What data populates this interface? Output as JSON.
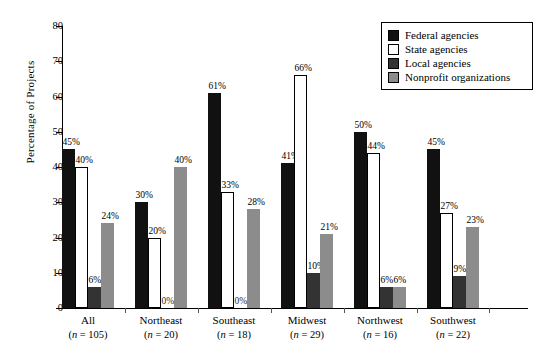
{
  "chart_data": {
    "type": "bar",
    "title": "",
    "xlabel": "",
    "ylabel": "Percentage of Projects",
    "ylim": [
      0,
      80
    ],
    "ytick_values": [
      0,
      10,
      20,
      30,
      40,
      50,
      60,
      70,
      80
    ],
    "ytick_labels": [
      "0",
      "10",
      "20",
      "30",
      "40",
      "50",
      "60",
      "70",
      "80"
    ],
    "grid": false,
    "legend_position": "top-right",
    "categories": [
      "All",
      "Northeast",
      "Southeast",
      "Midwest",
      "Northwest",
      "Southwest"
    ],
    "category_sublabels": [
      "(n = 105)",
      "(n = 20)",
      "(n = 18)",
      "(n = 29)",
      "(n = 16)",
      "(n = 22)"
    ],
    "series": [
      {
        "name": "Federal agencies",
        "color": "#111111",
        "values": [
          45,
          30,
          61,
          41,
          50,
          45
        ],
        "labels": [
          "45%",
          "30%",
          "61%",
          "41%",
          "50%",
          "45%"
        ]
      },
      {
        "name": "State agencies",
        "color": "#ffffff",
        "values": [
          40,
          20,
          33,
          66,
          44,
          27
        ],
        "labels": [
          "40%",
          "20%",
          "33%",
          "66%",
          "44%",
          "27%"
        ]
      },
      {
        "name": "Local agencies",
        "color": "#333333",
        "values": [
          6,
          0,
          0,
          10,
          6,
          9
        ],
        "labels": [
          "6%",
          "0%",
          "0%",
          "10%",
          "6%",
          "9%"
        ]
      },
      {
        "name": "Nonprofit organizations",
        "color": "#8c8c8c",
        "values": [
          24,
          40,
          28,
          21,
          6,
          23
        ],
        "labels": [
          "24%",
          "40%",
          "28%",
          "21%",
          "6%",
          "23%"
        ]
      }
    ]
  },
  "axis": {
    "y_label": "Percentage of Projects",
    "y_ticks": [
      "80",
      "70",
      "60",
      "50",
      "40",
      "30",
      "20",
      "10",
      "0"
    ]
  },
  "groups": [
    {
      "name": "All",
      "n": "(n = 105)",
      "bars": [
        {
          "label": "45%",
          "value": 45,
          "cls": "federal"
        },
        {
          "label": "40%",
          "value": 40,
          "cls": "state"
        },
        {
          "label": "6%",
          "value": 6,
          "cls": "local"
        },
        {
          "label": "24%",
          "value": 24,
          "cls": "nonprofit"
        }
      ]
    },
    {
      "name": "Northeast",
      "n": "(n = 20)",
      "bars": [
        {
          "label": "30%",
          "value": 30,
          "cls": "federal"
        },
        {
          "label": "20%",
          "value": 20,
          "cls": "state"
        },
        {
          "label": "0%",
          "value": 0,
          "cls": "local"
        },
        {
          "label": "40%",
          "value": 40,
          "cls": "nonprofit"
        }
      ]
    },
    {
      "name": "Southeast",
      "n": "(n = 18)",
      "bars": [
        {
          "label": "61%",
          "value": 61,
          "cls": "federal"
        },
        {
          "label": "33%",
          "value": 33,
          "cls": "state"
        },
        {
          "label": "0%",
          "value": 0,
          "cls": "local"
        },
        {
          "label": "28%",
          "value": 28,
          "cls": "nonprofit"
        }
      ]
    },
    {
      "name": "Midwest",
      "n": "(n = 29)",
      "bars": [
        {
          "label": "41%",
          "value": 41,
          "cls": "federal"
        },
        {
          "label": "66%",
          "value": 66,
          "cls": "state"
        },
        {
          "label": "10%",
          "value": 10,
          "cls": "local"
        },
        {
          "label": "21%",
          "value": 21,
          "cls": "nonprofit"
        }
      ]
    },
    {
      "name": "Northwest",
      "n": "(n = 16)",
      "bars": [
        {
          "label": "50%",
          "value": 50,
          "cls": "federal"
        },
        {
          "label": "44%",
          "value": 44,
          "cls": "state"
        },
        {
          "label": "6%",
          "value": 6,
          "cls": "local"
        },
        {
          "label": "6%",
          "value": 6,
          "cls": "nonprofit"
        }
      ]
    },
    {
      "name": "Southwest",
      "n": "(n = 22)",
      "bars": [
        {
          "label": "45%",
          "value": 45,
          "cls": "federal"
        },
        {
          "label": "27%",
          "value": 27,
          "cls": "state"
        },
        {
          "label": "9%",
          "value": 9,
          "cls": "local"
        },
        {
          "label": "23%",
          "value": 23,
          "cls": "nonprofit"
        }
      ]
    }
  ],
  "legend": {
    "items": [
      {
        "label": "Federal agencies",
        "cls": "federal"
      },
      {
        "label": "State agencies",
        "cls": "state"
      },
      {
        "label": "Local agencies",
        "cls": "local"
      },
      {
        "label": "Nonprofit organizations",
        "cls": "nonprofit"
      }
    ]
  }
}
